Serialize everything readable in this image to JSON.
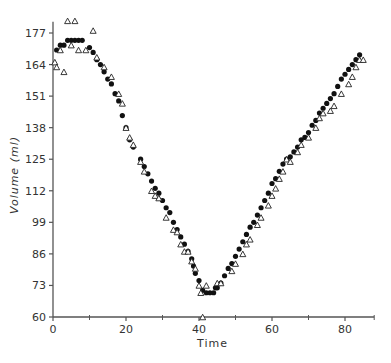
{
  "chart_data": {
    "type": "scatter",
    "title": "",
    "xlabel": "Time",
    "ylabel": "Volume (ml)",
    "xlim": [
      0,
      88
    ],
    "ylim": [
      60,
      180
    ],
    "grid": false,
    "legend": null,
    "x_ticks": [
      0,
      20,
      40,
      60,
      80
    ],
    "x_minor_ticks": [
      10,
      30,
      50,
      70,
      88
    ],
    "y_ticks": [
      60,
      73,
      86,
      99,
      112,
      125,
      138,
      151,
      164,
      177
    ],
    "series": [
      {
        "name": "filled-circles",
        "marker": "circle-filled",
        "points": [
          [
            1,
            170
          ],
          [
            2,
            172
          ],
          [
            3,
            172
          ],
          [
            4,
            174
          ],
          [
            5,
            174
          ],
          [
            6,
            174
          ],
          [
            7,
            174
          ],
          [
            8,
            174
          ],
          [
            10,
            171
          ],
          [
            11,
            169
          ],
          [
            12,
            166
          ],
          [
            13,
            164
          ],
          [
            14,
            161
          ],
          [
            15,
            158
          ],
          [
            16,
            156
          ],
          [
            17,
            152
          ],
          [
            18,
            149
          ],
          [
            19,
            143
          ],
          [
            20,
            138
          ],
          [
            21,
            133
          ],
          [
            22,
            130
          ],
          [
            24,
            125
          ],
          [
            25,
            122
          ],
          [
            26,
            119
          ],
          [
            27,
            116
          ],
          [
            28,
            113
          ],
          [
            29,
            111
          ],
          [
            30,
            108
          ],
          [
            31,
            105
          ],
          [
            32,
            103
          ],
          [
            33,
            99
          ],
          [
            34,
            96
          ],
          [
            35,
            93
          ],
          [
            36,
            90
          ],
          [
            37,
            87
          ],
          [
            38,
            84
          ],
          [
            38.5,
            81
          ],
          [
            39,
            78
          ],
          [
            40,
            75
          ],
          [
            41,
            71
          ],
          [
            42,
            70
          ],
          [
            43,
            70
          ],
          [
            44,
            70
          ],
          [
            44.5,
            72
          ],
          [
            45,
            72
          ],
          [
            46,
            74
          ],
          [
            47,
            77
          ],
          [
            48,
            80
          ],
          [
            49,
            82
          ],
          [
            50,
            85
          ],
          [
            51,
            88
          ],
          [
            52,
            91
          ],
          [
            53,
            94
          ],
          [
            54,
            97
          ],
          [
            55,
            99
          ],
          [
            56,
            102
          ],
          [
            57,
            105
          ],
          [
            58,
            108
          ],
          [
            59,
            111
          ],
          [
            60,
            115
          ],
          [
            61,
            117
          ],
          [
            62,
            120
          ],
          [
            63,
            123
          ],
          [
            64,
            125
          ],
          [
            65,
            126
          ],
          [
            66,
            128
          ],
          [
            67,
            130
          ],
          [
            68,
            133
          ],
          [
            69,
            134
          ],
          [
            70,
            136
          ],
          [
            71,
            139
          ],
          [
            72,
            141
          ],
          [
            73,
            144
          ],
          [
            74,
            146
          ],
          [
            75,
            148
          ],
          [
            76,
            150
          ],
          [
            77,
            152
          ],
          [
            78,
            155
          ],
          [
            79,
            158
          ],
          [
            80,
            160
          ],
          [
            81,
            162
          ],
          [
            82,
            164
          ],
          [
            83,
            166
          ],
          [
            84,
            168
          ]
        ]
      },
      {
        "name": "open-triangles",
        "marker": "triangle-open",
        "points": [
          [
            0.5,
            165
          ],
          [
            1,
            163
          ],
          [
            2,
            170
          ],
          [
            3,
            161
          ],
          [
            4,
            182
          ],
          [
            5,
            172
          ],
          [
            6,
            182
          ],
          [
            7,
            170
          ],
          [
            9,
            170
          ],
          [
            11,
            178
          ],
          [
            12,
            167
          ],
          [
            14,
            163
          ],
          [
            16,
            159
          ],
          [
            18,
            152
          ],
          [
            19,
            148
          ],
          [
            20,
            138
          ],
          [
            21,
            134
          ],
          [
            22,
            131
          ],
          [
            24,
            124
          ],
          [
            25,
            120
          ],
          [
            27,
            112
          ],
          [
            28,
            110
          ],
          [
            29,
            109
          ],
          [
            31,
            101
          ],
          [
            33,
            96
          ],
          [
            34,
            95
          ],
          [
            35,
            90
          ],
          [
            36,
            87
          ],
          [
            37,
            87
          ],
          [
            38,
            83
          ],
          [
            39,
            80
          ],
          [
            40,
            73
          ],
          [
            40.5,
            70
          ],
          [
            41,
            60
          ],
          [
            42,
            73
          ],
          [
            45,
            74
          ],
          [
            46,
            74
          ],
          [
            49,
            79
          ],
          [
            50,
            82
          ],
          [
            52,
            86
          ],
          [
            53,
            90
          ],
          [
            54,
            92
          ],
          [
            56,
            98
          ],
          [
            57,
            101
          ],
          [
            59,
            106
          ],
          [
            60,
            110
          ],
          [
            61,
            113
          ],
          [
            62,
            117
          ],
          [
            63,
            120
          ],
          [
            64,
            125
          ],
          [
            65,
            124
          ],
          [
            67,
            128
          ],
          [
            68,
            131
          ],
          [
            70,
            134
          ],
          [
            72,
            138
          ],
          [
            73,
            142
          ],
          [
            74,
            144
          ],
          [
            76,
            145
          ],
          [
            77,
            147
          ],
          [
            79,
            152
          ],
          [
            81,
            156
          ],
          [
            82,
            159
          ],
          [
            83,
            163
          ],
          [
            84,
            166
          ],
          [
            85,
            166
          ]
        ]
      }
    ]
  }
}
